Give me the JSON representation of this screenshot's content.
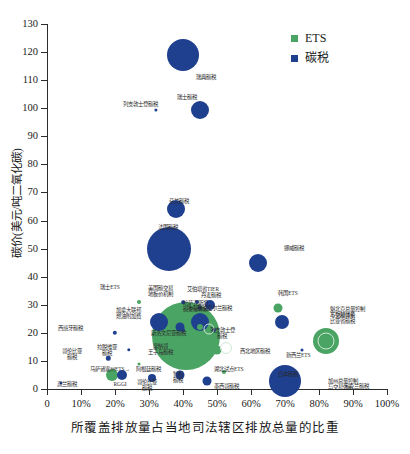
{
  "chart_data": {
    "type": "scatter",
    "title": "",
    "xlabel": "所覆盖排放量占当地司法辖区排放总量的比重",
    "ylabel": "碳价(美元/吨二氧化碳)",
    "xlim": [
      0,
      100
    ],
    "ylim": [
      0,
      130
    ],
    "ytick_values": [
      0,
      10,
      20,
      30,
      40,
      50,
      60,
      70,
      80,
      90,
      100,
      110,
      120,
      130
    ],
    "ytick_labels": [
      "0",
      "10",
      "20",
      "30",
      "40",
      "50",
      "60",
      "70",
      "80",
      "90",
      "100",
      "110",
      "120",
      "130"
    ],
    "xtick_values": [
      0,
      10,
      20,
      30,
      40,
      50,
      60,
      70,
      80,
      90,
      100
    ],
    "xtick_labels": [
      "0",
      "10%",
      "20%",
      "30%",
      "40%",
      "50%",
      "60%",
      "70%",
      "80%",
      "90%",
      "100%"
    ],
    "grid": false,
    "legend_position": "top-right",
    "size_encoding": "bubble area ~ covered emissions volume",
    "series": [
      {
        "name": "ETS",
        "color": "#4aa564"
      },
      {
        "name": "碳税",
        "color": "#1f3f8f"
      }
    ],
    "points": [
      {
        "label": "瑞典碳税",
        "x": 40,
        "y": 119,
        "r": 16,
        "type": "碳税"
      },
      {
        "label": "瑞士碳税",
        "x": 45,
        "y": 99.5,
        "r": 9,
        "type": "碳税"
      },
      {
        "label": "列支敦士登碳税",
        "x": 32,
        "y": 99.5,
        "r": 1.6,
        "type": "碳税"
      },
      {
        "label": "芬兰碳税",
        "x": 38,
        "y": 64,
        "r": 9,
        "type": "碳税"
      },
      {
        "label": "法国碳税",
        "x": 36,
        "y": 50,
        "r": 22,
        "type": "碳税"
      },
      {
        "label": "挪威碳税",
        "x": 62,
        "y": 45,
        "r": 9,
        "type": "碳税"
      },
      {
        "label": "丹麦碳税",
        "x": 45,
        "y": 29,
        "r": 2.2,
        "type": "碳税"
      },
      {
        "label": "韩国ETS",
        "x": 68,
        "y": 29,
        "r": 4.5,
        "type": "ETS"
      },
      {
        "label": "冰岛碳税",
        "x": 48,
        "y": 30,
        "r": 5,
        "type": "碳税"
      },
      {
        "label": "艾伯塔省TIER",
        "x": 44,
        "y": 31,
        "r": 2,
        "type": "碳税"
      },
      {
        "label": "美国碳交易地板价机制",
        "x": 40,
        "y": 31,
        "r": 1.8,
        "type": "碳税"
      },
      {
        "label": "瑞士ETS",
        "x": 27,
        "y": 31,
        "r": 2,
        "type": "ETS"
      },
      {
        "label": "加拿大联邦燃油附加费",
        "x": 33,
        "y": 24,
        "r": 9,
        "type": "碳税"
      },
      {
        "label": "爱尔兰碳税",
        "x": 45,
        "y": 24,
        "r": 9,
        "type": "碳税"
      },
      {
        "label": "不列颠哥伦比亚省碳税",
        "x": 69,
        "y": 24,
        "r": 7,
        "type": "碳税"
      },
      {
        "label": "斯洛文尼亚碳税",
        "x": 40,
        "y": 21,
        "r": 2,
        "type": "碳税"
      },
      {
        "label": "列支敦士登碳税2",
        "x": 49,
        "y": 21,
        "r": 2,
        "type": "碳税"
      },
      {
        "label": "西班牙碳税",
        "x": 20,
        "y": 20,
        "r": 2.2,
        "type": "碳税"
      },
      {
        "label": "拉脱维亚碳税",
        "x": 24,
        "y": 14,
        "r": 1.7,
        "type": "碳税"
      },
      {
        "label": "哥伦比亚碳税",
        "x": 18,
        "y": 11,
        "r": 2.2,
        "type": "碳税"
      },
      {
        "label": "马萨诸塞州ETS",
        "x": 27,
        "y": 9,
        "r": 1.5,
        "type": "ETS"
      },
      {
        "label": "高兰碳税",
        "x": 4,
        "y": 2,
        "r": 1.5,
        "type": "碳税"
      },
      {
        "label": "RGGI",
        "x": 19,
        "y": 5,
        "r": 6,
        "type": "ETS"
      },
      {
        "label": "阿根廷碳税",
        "x": 22,
        "y": 5,
        "r": 5,
        "type": "碳税"
      },
      {
        "label": "智利碳税",
        "x": 39,
        "y": 5,
        "r": 4.5,
        "type": "碳税"
      },
      {
        "label": "哥伦比亚碳税2",
        "x": 31,
        "y": 4,
        "r": 4,
        "type": "碳税"
      },
      {
        "label": "墨西哥碳税",
        "x": 47,
        "y": 3,
        "r": 4.5,
        "type": "碳税"
      },
      {
        "label": "湖北试点ETS",
        "x": 52,
        "y": 6,
        "r": 2,
        "type": "ETS"
      },
      {
        "label": "日本碳税",
        "x": 69,
        "y": 7,
        "r": 2,
        "type": "碳税"
      },
      {
        "label": "乌克兰碳税",
        "x": 70,
        "y": 3,
        "r": 16,
        "type": "碳税"
      },
      {
        "label": "欧盟ETS",
        "x": 41,
        "y": 19,
        "r": 34,
        "type": "ETS"
      },
      {
        "label": "摩纳哥王子岛碳税",
        "x": 39,
        "y": 22,
        "r": 4.5,
        "type": "碳税"
      },
      {
        "label": "哈萨克斯坦碳排放交易体系",
        "x": 45,
        "y": 22,
        "r": 3,
        "type": "ETS"
      },
      {
        "label": "新西兰ETS",
        "x": 50,
        "y": 14,
        "r": 4.5,
        "type": "ETS"
      },
      {
        "label": "魁北克总量控制与交易体系",
        "x": 82,
        "y": 17,
        "r": 13,
        "type": "ETS"
      },
      {
        "label": "加州总量控制与交易体系",
        "x": 82,
        "y": 17,
        "r": 7,
        "type": "ETS"
      },
      {
        "label": "西北地区碳税",
        "x": 75,
        "y": 14,
        "r": 1.5,
        "type": "碳税"
      }
    ]
  },
  "legend": {
    "items": [
      {
        "label": "ETS",
        "color": "#4aa564"
      },
      {
        "label": "碳税",
        "color": "#1f3f8f"
      }
    ]
  },
  "axes": {
    "x_title": "所覆盖排放量占当地司法辖区排放总量的比重",
    "y_title": "碳价(美元/吨二氧化碳)",
    "y_ticks": [
      "130",
      "120",
      "110",
      "100",
      "90",
      "80",
      "70",
      "60",
      "50",
      "40",
      "30",
      "20",
      "10",
      "0"
    ],
    "x_ticks": [
      "0",
      "10%",
      "20%",
      "30%",
      "40%",
      "50%",
      "60%",
      "70%",
      "80%",
      "90%",
      "100%"
    ]
  },
  "annotations": {
    "sweden": "瑞典碳税",
    "switzerland": "瑞士碳税",
    "liechtenstein": "列支敦士登碳税",
    "finland": "芬兰碳税",
    "france": "法国碳税",
    "norway": "挪威碳税",
    "denmark": "丹麦碳税",
    "korea_ets": "韩国ETS",
    "iceland": "冰岛碳税",
    "alberta_tier": "艾伯塔省TIER",
    "us_price_floor": "美国碳交易\n地板价机制",
    "switzerland_ets": "瑞士ETS",
    "canada_fuel_charge": "加拿大联邦\n燃油附加费",
    "ireland": "爱尔兰碳税",
    "bc_tax": "不列颠哥伦\n比亚省碳税",
    "slovenia": "斯洛文尼亚碳税",
    "liechtenstein2": "列支敦士登\n碳税",
    "spain": "西班牙碳税",
    "latvia": "拉脱维亚\n碳税",
    "colombia": "哥伦比亚\n碳税",
    "massachusetts_ets": "马萨诸塞州ETS→",
    "ukraine_low": "高兰碳税",
    "rggi": "RGGI",
    "argentina": "阿根廷碳税",
    "chile": "智利\n碳税",
    "colombia2": "哥伦比亚\n碳税",
    "mexico": "墨西哥碳税",
    "hubei_ets": "湖北试点ETS",
    "japan": "日本碳税",
    "ukraine": "乌克兰碳税",
    "eu_ets": "欧盟ETS",
    "monaco": "摩纳哥\n王子岛碳税",
    "kazakhstan": "哈萨克斯坦\n碳交易体系",
    "nz_ets": "新西兰ETS",
    "quebec": "魁北克总量控制\n与交易体系",
    "california": "加州总量控制\n与交易体系",
    "nwt": "西北地区碳税"
  }
}
